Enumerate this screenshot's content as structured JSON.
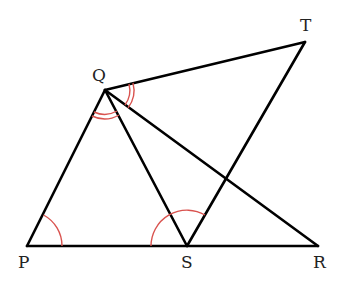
{
  "diagram": {
    "colors": {
      "line": "#000000",
      "arc": "#d9534f"
    },
    "points": {
      "P": {
        "label": "P",
        "x": 27,
        "y": 246
      },
      "Q": {
        "label": "Q",
        "x": 105,
        "y": 90
      },
      "R": {
        "label": "R",
        "x": 318,
        "y": 246
      },
      "S": {
        "label": "S",
        "x": 187,
        "y": 246
      },
      "T": {
        "label": "T",
        "x": 305,
        "y": 42
      }
    },
    "segments": [
      "PQ",
      "PR",
      "QS",
      "QR",
      "QT",
      "ST"
    ],
    "angle_marks": [
      {
        "vertex": "P",
        "between": [
          "Q",
          "S"
        ],
        "arcs": 1
      },
      {
        "vertex": "S",
        "between": [
          "P",
          "Q"
        ],
        "arcs": 1
      },
      {
        "vertex": "Q",
        "between": [
          "P",
          "S"
        ],
        "arcs": 2
      },
      {
        "vertex": "Q",
        "between": [
          "T",
          "R"
        ],
        "arcs": 2
      }
    ]
  }
}
